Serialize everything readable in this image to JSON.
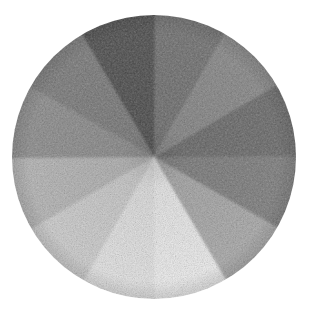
{
  "artwork": {
    "title": "Grayscale Value Wheel",
    "medium": "graphite pencil on paper",
    "subject": "twelve-step value scale arranged radially",
    "background_color": "#ffffff"
  },
  "chart_data": {
    "type": "pie",
    "xlabel": "",
    "ylabel": "",
    "legend_position": "none",
    "grid": false,
    "center_x": 154,
    "center_y": 157,
    "radius": 142,
    "slice_count": 12,
    "slice_degrees": 30,
    "categories": [
      "step-01",
      "step-02",
      "step-03",
      "step-04",
      "step-05",
      "step-06",
      "step-07",
      "step-08",
      "step-09",
      "step-10",
      "step-11",
      "step-12"
    ],
    "values": [
      30,
      30,
      30,
      30,
      30,
      30,
      30,
      30,
      30,
      30,
      30,
      30
    ],
    "colors": [
      "#6f6f6f",
      "#878787",
      "#6a6a6a",
      "#7d7d7d",
      "#a8a8a8",
      "#ededed",
      "#e3e3e3",
      "#cccccc",
      "#b4b4b4",
      "#8c8c8c",
      "#7a7a7a",
      "#4d4d4d"
    ],
    "slices": [
      {
        "name": "step-01",
        "label": "value 6 — mid gray",
        "start_deg": 0,
        "end_deg": 30,
        "color": "#6f6f6f",
        "lightness_pct": 44
      },
      {
        "name": "step-02",
        "label": "value 5 — medium gray",
        "start_deg": 30,
        "end_deg": 60,
        "color": "#878787",
        "lightness_pct": 53
      },
      {
        "name": "step-03",
        "label": "value 7 — dark medium gray",
        "start_deg": 60,
        "end_deg": 90,
        "color": "#6a6a6a",
        "lightness_pct": 42
      },
      {
        "name": "step-04",
        "label": "value 6 — mid dark gray",
        "start_deg": 90,
        "end_deg": 120,
        "color": "#7d7d7d",
        "lightness_pct": 49
      },
      {
        "name": "step-05",
        "label": "value 4 — light medium gray",
        "start_deg": 120,
        "end_deg": 150,
        "color": "#a8a8a8",
        "lightness_pct": 66
      },
      {
        "name": "step-06",
        "label": "value 1 — near white",
        "start_deg": 150,
        "end_deg": 180,
        "color": "#ededed",
        "lightness_pct": 93
      },
      {
        "name": "step-07",
        "label": "value 1 — highlight white",
        "start_deg": 180,
        "end_deg": 210,
        "color": "#e3e3e3",
        "lightness_pct": 89
      },
      {
        "name": "step-08",
        "label": "value 2 — light gray",
        "start_deg": 210,
        "end_deg": 240,
        "color": "#cccccc",
        "lightness_pct": 80
      },
      {
        "name": "step-09",
        "label": "value 3 — light mid gray",
        "start_deg": 240,
        "end_deg": 270,
        "color": "#b4b4b4",
        "lightness_pct": 71
      },
      {
        "name": "step-10",
        "label": "value 5 — medium gray",
        "start_deg": 270,
        "end_deg": 300,
        "color": "#8c8c8c",
        "lightness_pct": 55
      },
      {
        "name": "step-11",
        "label": "value 6 — mid gray",
        "start_deg": 300,
        "end_deg": 330,
        "color": "#7a7a7a",
        "lightness_pct": 48
      },
      {
        "name": "step-12",
        "label": "value 9 — darkest, near black",
        "start_deg": 330,
        "end_deg": 360,
        "color": "#4d4d4d",
        "lightness_pct": 30
      }
    ],
    "darkest_color": "#4d4d4d",
    "lightest_color": "#ededed"
  }
}
